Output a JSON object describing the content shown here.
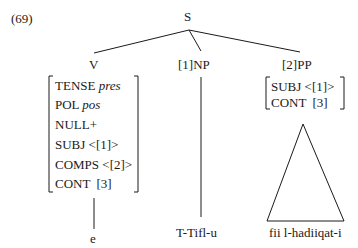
{
  "example_number": "(69)",
  "tree": {
    "root": {
      "label": "S"
    },
    "children": [
      {
        "label": "V",
        "avm": [
          {
            "attr": "TENSE",
            "value": "pres",
            "value_italic": true
          },
          {
            "attr": "POL",
            "value": "pos",
            "value_italic": true
          },
          {
            "attr": "NULL+",
            "value": ""
          },
          {
            "attr": "SUBJ",
            "value": "<[1]>"
          },
          {
            "attr": "COMPS",
            "value": "<[2]>"
          },
          {
            "attr": "CONT",
            "value": "[3]"
          }
        ],
        "leaf": "e",
        "branch": "line"
      },
      {
        "label": "[1]NP",
        "leaf": "T-Tifl-u",
        "branch": "line"
      },
      {
        "label": "[2]PP",
        "avm": [
          {
            "attr": "SUBJ",
            "value": "<[1]>"
          },
          {
            "attr": "CONT",
            "value": "[3]"
          }
        ],
        "leaf": "fii l-hadiiqat-i",
        "branch": "triangle"
      }
    ]
  },
  "colors": {
    "ink": "#1a1a1a",
    "background": "#ffffff"
  }
}
